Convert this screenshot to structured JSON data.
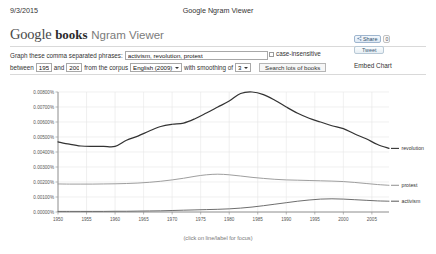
{
  "print_header": {
    "date": "9/3/2015",
    "title": "Google Ngram Viewer"
  },
  "brand": {
    "google": "Google",
    "books": "books",
    "product": "Ngram Viewer"
  },
  "query_form": {
    "phrases_label": "Graph these comma separated phrases:",
    "phrases_value": "activism, revolution, protest",
    "phrases_placeholder": "",
    "case_insensitive_label": "case-insensitive",
    "case_insensitive_checked": false,
    "between_label": "between",
    "start_year": "1950",
    "and_label": "and",
    "end_year": "2008",
    "corpus_label": "from the corpus",
    "corpus_value": "English (2009)",
    "corpus_options": [
      "English (2009)",
      "English (2012)",
      "American English (2009)",
      "British English (2009)"
    ],
    "smoothing_label": "with smoothing of",
    "smoothing_value": "3",
    "smoothing_options": [
      "0",
      "1",
      "2",
      "3",
      "5",
      "10",
      "20",
      "50"
    ],
    "search_button": "Search lots of books"
  },
  "share": {
    "share_label": "Share",
    "share_count": "0",
    "tweet_label": "Tweet",
    "embed_label": "Embed Chart"
  },
  "chart_caption": "(click on line/label for focus)",
  "colors": {
    "revolution": "#333333",
    "protest": "#999999",
    "activism": "#666666",
    "grid": "#e6e6e6",
    "axis": "#888888"
  },
  "chart_data": {
    "type": "line",
    "title": "",
    "xlabel": "",
    "ylabel": "",
    "xlim": [
      1950,
      2008
    ],
    "ylim": [
      0.0,
      0.008
    ],
    "grid": true,
    "legend_position": "right",
    "ytick_labels": [
      "0.00800%",
      "0.00700%",
      "0.00600%",
      "0.00500%",
      "0.00400%",
      "0.00300%",
      "0.00200%",
      "0.00100%",
      "0.00000%"
    ],
    "ytick_values": [
      0.008,
      0.007,
      0.006,
      0.005,
      0.004,
      0.003,
      0.002,
      0.001,
      0.0
    ],
    "xtick_labels": [
      "1950",
      "1955",
      "1960",
      "1965",
      "1970",
      "1975",
      "1980",
      "1985",
      "1990",
      "1995",
      "2000",
      "2005"
    ],
    "xtick_values": [
      1950,
      1955,
      1960,
      1965,
      1970,
      1975,
      1980,
      1985,
      1990,
      1995,
      2000,
      2005
    ],
    "x": [
      1950,
      1952,
      1954,
      1956,
      1958,
      1960,
      1962,
      1964,
      1966,
      1968,
      1970,
      1972,
      1974,
      1976,
      1978,
      1980,
      1982,
      1984,
      1986,
      1988,
      1990,
      1992,
      1994,
      1996,
      1998,
      2000,
      2002,
      2004,
      2006,
      2008
    ],
    "series": [
      {
        "name": "revolution",
        "color": "#333333",
        "values": [
          0.00468,
          0.00452,
          0.0044,
          0.00437,
          0.00437,
          0.00437,
          0.00478,
          0.00506,
          0.0054,
          0.0057,
          0.00585,
          0.00593,
          0.00622,
          0.0066,
          0.007,
          0.0074,
          0.0079,
          0.008,
          0.00783,
          0.00745,
          0.007,
          0.00658,
          0.00625,
          0.006,
          0.00575,
          0.00556,
          0.0052,
          0.00488,
          0.0045,
          0.00424
        ]
      },
      {
        "name": "protest",
        "color": "#999999",
        "values": [
          0.00187,
          0.00186,
          0.00186,
          0.00186,
          0.00187,
          0.00188,
          0.0019,
          0.00193,
          0.00198,
          0.00205,
          0.00214,
          0.00225,
          0.00238,
          0.00248,
          0.00252,
          0.00248,
          0.0024,
          0.00231,
          0.00224,
          0.00218,
          0.00214,
          0.00212,
          0.0021,
          0.00208,
          0.00206,
          0.00203,
          0.00197,
          0.0019,
          0.00183,
          0.00178
        ]
      },
      {
        "name": "activism",
        "color": "#666666",
        "values": [
          4e-05,
          4e-05,
          4e-05,
          4e-05,
          4e-05,
          5e-05,
          5e-05,
          6e-05,
          7e-05,
          8e-05,
          0.0001,
          0.00012,
          0.00014,
          0.00016,
          0.00018,
          0.00021,
          0.00026,
          0.00033,
          0.00042,
          0.00052,
          0.00062,
          0.00072,
          0.0008,
          0.00086,
          0.00088,
          0.00086,
          0.00082,
          0.00078,
          0.00074,
          0.00072
        ]
      }
    ]
  }
}
